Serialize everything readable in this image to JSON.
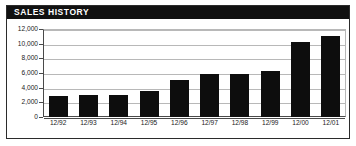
{
  "panel": {
    "title": "SALES HISTORY",
    "frame_color": "#2b2b2b",
    "title_bar_color": "#111111",
    "title_text_color": "#ffffff",
    "bar_color": "#0d0d0d",
    "gridline_color": "#b8b8b8",
    "axis_color": "#4a4a4a",
    "background_color": "#ffffff"
  },
  "chart_data": {
    "type": "bar",
    "title": "SALES HISTORY",
    "xlabel": "",
    "ylabel": "",
    "categories": [
      "12/92",
      "12/93",
      "12/94",
      "12/95",
      "12/96",
      "12/97",
      "12/98",
      "12/99",
      "12/00",
      "12/01"
    ],
    "values": [
      2900,
      3000,
      3050,
      3600,
      5100,
      5900,
      5800,
      6300,
      10200,
      11000
    ],
    "ylim": [
      0,
      12000
    ],
    "ytick_values": [
      0,
      2000,
      4000,
      6000,
      8000,
      10000,
      12000
    ],
    "ytick_labels": [
      "0",
      "2,000",
      "4,000",
      "6,000",
      "8,000",
      "10,000",
      "12,000"
    ],
    "grid": true,
    "legend": false,
    "orientation": "vertical"
  }
}
